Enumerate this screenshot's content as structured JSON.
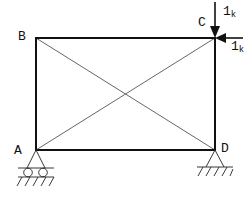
{
  "diagram": {
    "type": "truss-frame",
    "nodes": [
      {
        "id": "A",
        "label": "A",
        "x": 36,
        "y": 150,
        "support": "roller"
      },
      {
        "id": "B",
        "label": "B",
        "x": 36,
        "y": 38,
        "support": "none"
      },
      {
        "id": "C",
        "label": "C",
        "x": 215,
        "y": 38,
        "support": "none"
      },
      {
        "id": "D",
        "label": "D",
        "x": 215,
        "y": 150,
        "support": "pin"
      }
    ],
    "members": [
      {
        "from": "A",
        "to": "B",
        "kind": "frame"
      },
      {
        "from": "B",
        "to": "C",
        "kind": "frame"
      },
      {
        "from": "C",
        "to": "D",
        "kind": "frame"
      },
      {
        "from": "D",
        "to": "A",
        "kind": "frame"
      },
      {
        "from": "A",
        "to": "C",
        "kind": "diagonal"
      },
      {
        "from": "B",
        "to": "D",
        "kind": "diagonal"
      }
    ],
    "loads": [
      {
        "node": "C",
        "direction": "down",
        "magnitude": "1",
        "unit": "k"
      },
      {
        "node": "C",
        "direction": "left",
        "magnitude": "1",
        "unit": "k"
      }
    ],
    "colors": {
      "frame": "#111111",
      "diagonal": "#555555",
      "background": "#ffffff"
    }
  },
  "labels": {
    "A": "A",
    "B": "B",
    "C": "C",
    "D": "D",
    "load_vertical_value": "1",
    "load_vertical_unit": "k",
    "load_horizontal_value": "1",
    "load_horizontal_unit": "k"
  }
}
